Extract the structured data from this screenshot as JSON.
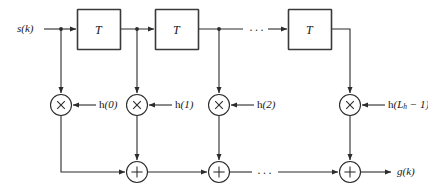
{
  "figure": {
    "input_label": "s(k)",
    "output_label": "g(k)",
    "delay_label": "T",
    "ellipsis": "···",
    "multiply_symbol": "×",
    "add_symbol": "+",
    "line_color": "#2b2b2b",
    "box_fill": "#ffffff",
    "box_stroke": "#3a3a3a",
    "background": "#ffffff",
    "delays": [
      {
        "label": "T"
      },
      {
        "label": "T"
      },
      {
        "label": "T"
      }
    ],
    "taps": [
      {
        "coef": "h(0)",
        "coef_base": "h(",
        "coef_arg": "0",
        "coef_close": ")"
      },
      {
        "coef": "h(1)",
        "coef_base": "h(",
        "coef_arg": "1",
        "coef_close": ")"
      },
      {
        "coef": "h(2)",
        "coef_base": "h(",
        "coef_arg": "2",
        "coef_close": ")"
      },
      {
        "coef": "h(Lh − 1)",
        "coef_base": "h(",
        "coef_arg": "L",
        "coef_sub": "h",
        "coef_close": " − 1)"
      }
    ]
  }
}
